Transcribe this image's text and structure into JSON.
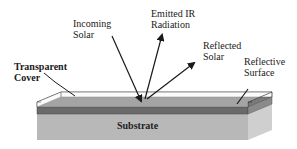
{
  "diagram": {
    "labels": {
      "incoming_solar_line1": "Incoming",
      "incoming_solar_line2": "Solar",
      "emitted_ir_line1": "Emitted IR",
      "emitted_ir_line2": "Radiation",
      "reflected_solar_line1": "Reflected",
      "reflected_solar_line2": "Solar",
      "reflective_surface_line1": "Reflective",
      "reflective_surface_line2": "Surface",
      "transparent_cover_line1": "Transparent",
      "transparent_cover_line2": "Cover",
      "substrate": "Substrate"
    },
    "colors": {
      "background": "#ffffff",
      "transparent_cover": "#f4f4f4",
      "reflective_surface_top": "#7a7a7a",
      "reflective_surface_front": "#6a6a6a",
      "substrate_front": "#b8b8b8",
      "substrate_side": "#cfcfcf",
      "line": "#1a1a1a"
    }
  }
}
